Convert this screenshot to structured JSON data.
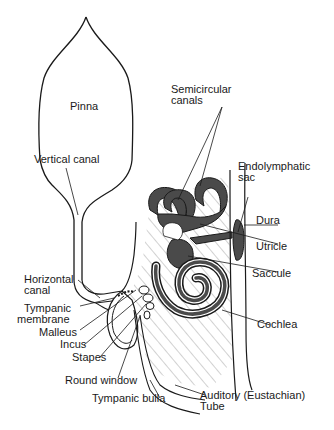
{
  "figure": {
    "colors": {
      "line": "#1a1a1a",
      "fluid": "#4a4a4a",
      "hatch": "#9a9a9a",
      "background": "#ffffff"
    }
  },
  "labels": {
    "pinna": "Pinna",
    "vertical_canal": "Vertical canal",
    "semicircular_canals_1": "Semicircular",
    "semicircular_canals_2": "canals",
    "endolymphatic_sac_1": "Endolymphatic",
    "endolymphatic_sac_2": "sac",
    "dura": "Dura",
    "utricle": "Utricle",
    "saccule": "Saccule",
    "horizontal_canal_1": "Horizontal",
    "horizontal_canal_2": "canal",
    "tympanic_membrane_1": "Tympanic",
    "tympanic_membrane_2": "membrane",
    "malleus": "Malleus",
    "incus": "Incus",
    "stapes": "Stapes",
    "cochlea": "Cochlea",
    "round_window": "Round window",
    "tympanic_bulla": "Tympanic bulla",
    "auditory_tube_1": "Auditory (Eustachian)",
    "auditory_tube_2": "Tube"
  }
}
